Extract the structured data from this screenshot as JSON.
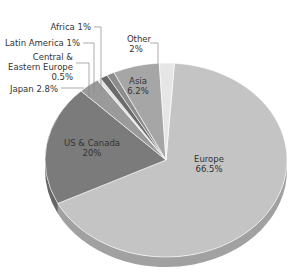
{
  "chart_data": {
    "type": "pie",
    "title": "",
    "style": "3d",
    "categories": [
      "Europe",
      "US & Canada",
      "Japan",
      "Central & Eastern Europe",
      "Latin America",
      "Africa",
      "Asia",
      "Other"
    ],
    "values": [
      66.5,
      20,
      2.8,
      0.5,
      1,
      1,
      6.2,
      2
    ],
    "labels": [
      "Europe\n66.5%",
      "US & Canada\n20%",
      "Japan 2.8%",
      "Central &\nEastern Europe\n0.5%",
      "Latin America 1%",
      "Africa 1%",
      "Asia\n6.2%",
      "Other\n2%"
    ],
    "colors": [
      "#c4c4c4",
      "#7b7b7b",
      "#9a9a9a",
      "#e2e2e2",
      "#6a6a6a",
      "#8c8c8c",
      "#a6a6a6",
      "#e6e6e6"
    ],
    "legend": "none (callout labels)"
  },
  "labels": {
    "europe_name": "Europe",
    "europe_pct": "66.5%",
    "us_name": "US & Canada",
    "us_pct": "20%",
    "japan": "Japan 2.8%",
    "cee_1": "Central &",
    "cee_2": "Eastern Europe",
    "cee_3": "0.5%",
    "latam": "Latin America 1%",
    "africa": "Africa 1%",
    "asia_name": "Asia",
    "asia_pct": "6.2%",
    "other_name": "Other",
    "other_pct": "2%"
  }
}
